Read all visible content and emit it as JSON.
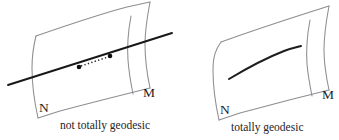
{
  "figure": {
    "background_color": "#ffffff",
    "edge_color": "#8d8d92",
    "curve_color": "#18181a",
    "label_color": "#1b1b1e",
    "panels": [
      {
        "id": "left",
        "caption": "not totally geodesic",
        "submanifold_label": "N",
        "ambient_label": "M",
        "curve_kind": "straight-line-with-dotted-segment",
        "dot_count": 2
      },
      {
        "id": "right",
        "caption": "totally geodesic",
        "submanifold_label": "N",
        "ambient_label": "M",
        "curve_kind": "contained-curved-arc",
        "dot_count": 0
      }
    ]
  }
}
